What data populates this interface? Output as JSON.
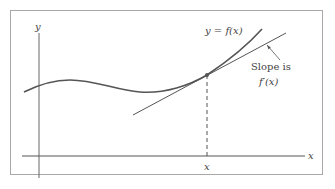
{
  "diagram": {
    "axes": {
      "y_label": "y",
      "x_label": "x"
    },
    "curve_label": "y = f(x)",
    "point_label": "x",
    "annotation": {
      "line1": "Slope is",
      "line2": "f′(x)"
    },
    "colors": {
      "frame": "#9a9a9a",
      "axis": "#555555",
      "curve": "#555555",
      "tangent": "#555555",
      "text": "#444444"
    }
  }
}
